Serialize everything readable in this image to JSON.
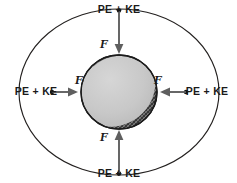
{
  "diagram": {
    "canvas": {
      "width": 237,
      "height": 183,
      "background": "#ffffff"
    },
    "center": {
      "x": 119,
      "y": 92
    },
    "outer_ring": {
      "name": "orbital-shell",
      "rx": 100,
      "ry": 83,
      "stroke": "#23201f"
    },
    "sphere": {
      "name": "central-mass",
      "rx": 38,
      "ry": 37,
      "fill": "#c9c9c9",
      "stroke": "#1b1b1b",
      "shadow_fill": "#2a2a2a"
    },
    "energy_labels": [
      {
        "position": "top",
        "text": "PE + KE",
        "x": 119,
        "y": 13
      },
      {
        "position": "left",
        "text": "PE + KE",
        "x": 36,
        "y": 95
      },
      {
        "position": "right",
        "text": "PE + KE",
        "x": 207,
        "y": 95
      },
      {
        "position": "bottom",
        "text": "PE + KE",
        "x": 119,
        "y": 176
      }
    ],
    "force_labels": [
      {
        "position": "top",
        "text": "F",
        "x": 104,
        "y": 48
      },
      {
        "position": "left",
        "text": "F",
        "x": 79,
        "y": 83
      },
      {
        "position": "right",
        "text": "F",
        "x": 157,
        "y": 83
      },
      {
        "position": "bottom",
        "text": "F",
        "x": 104,
        "y": 140
      }
    ],
    "arrows": [
      {
        "name": "force-arrow-top",
        "direction": "down",
        "color": "#5f5f5f"
      },
      {
        "name": "force-arrow-left",
        "direction": "right",
        "color": "#5f5f5f"
      },
      {
        "name": "force-arrow-right",
        "direction": "left",
        "color": "#5f5f5f"
      },
      {
        "name": "force-arrow-bottom",
        "direction": "up",
        "color": "#5f5f5f"
      }
    ]
  }
}
